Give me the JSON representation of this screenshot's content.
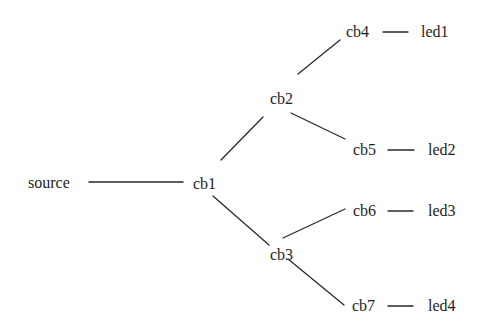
{
  "diagram": {
    "type": "tree",
    "background": "#ffffff",
    "line_color": "#2a2a2a",
    "text_color": "#1e1e1e",
    "nodes": [
      {
        "id": "source",
        "label": "source",
        "x": 28,
        "y": 175
      },
      {
        "id": "cb1",
        "label": "cb1",
        "x": 193,
        "y": 176
      },
      {
        "id": "cb2",
        "label": "cb2",
        "x": 270,
        "y": 91
      },
      {
        "id": "cb3",
        "label": "cb3",
        "x": 270,
        "y": 247
      },
      {
        "id": "cb4",
        "label": "cb4",
        "x": 346,
        "y": 24
      },
      {
        "id": "cb5",
        "label": "cb5",
        "x": 353,
        "y": 142
      },
      {
        "id": "cb6",
        "label": "cb6",
        "x": 353,
        "y": 203
      },
      {
        "id": "cb7",
        "label": "cb7",
        "x": 352,
        "y": 298
      },
      {
        "id": "led1",
        "label": "led1",
        "x": 421,
        "y": 24
      },
      {
        "id": "led2",
        "label": "led2",
        "x": 428,
        "y": 142
      },
      {
        "id": "led3",
        "label": "led3",
        "x": 428,
        "y": 203
      },
      {
        "id": "led4",
        "label": "led4",
        "x": 428,
        "y": 298
      }
    ],
    "edges": [
      {
        "from": "source",
        "to": "cb1",
        "x1": 89,
        "y1": 182,
        "x2": 183,
        "y2": 182
      },
      {
        "from": "cb1",
        "to": "cb2",
        "x1": 221,
        "y1": 160,
        "x2": 263,
        "y2": 117
      },
      {
        "from": "cb2",
        "to": "cb4",
        "x1": 298,
        "y1": 74,
        "x2": 340,
        "y2": 40
      },
      {
        "from": "cb2",
        "to": "cb5",
        "x1": 291,
        "y1": 113,
        "x2": 345,
        "y2": 139
      },
      {
        "from": "cb1",
        "to": "cb3",
        "x1": 213,
        "y1": 196,
        "x2": 269,
        "y2": 245
      },
      {
        "from": "cb3",
        "to": "cb6",
        "x1": 283,
        "y1": 238,
        "x2": 345,
        "y2": 209
      },
      {
        "from": "cb3",
        "to": "cb7",
        "x1": 288,
        "y1": 259,
        "x2": 344,
        "y2": 305
      },
      {
        "from": "cb4",
        "to": "led1",
        "x1": 383,
        "y1": 32,
        "x2": 408,
        "y2": 32
      },
      {
        "from": "cb5",
        "to": "led2",
        "x1": 388,
        "y1": 150,
        "x2": 414,
        "y2": 150
      },
      {
        "from": "cb6",
        "to": "led3",
        "x1": 388,
        "y1": 211,
        "x2": 413,
        "y2": 211
      },
      {
        "from": "cb7",
        "to": "led4",
        "x1": 388,
        "y1": 306,
        "x2": 413,
        "y2": 306
      }
    ]
  }
}
